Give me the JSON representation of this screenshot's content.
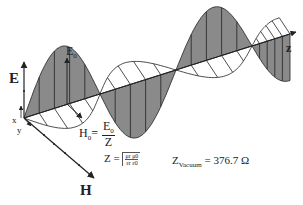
{
  "diagram": {
    "axes": {
      "E": "E",
      "H": "H",
      "z": "z",
      "x": "x",
      "y": "y"
    },
    "labels": {
      "E0_main": "E",
      "E0_sub": "0",
      "H0_main": "H",
      "H0_sub": "0",
      "H0_eq": "=",
      "H0_num_main": "E",
      "H0_num_sub": "0",
      "H0_den": "Z",
      "Z_lhs": "Z =",
      "Z_num": "μr μ0",
      "Z_den": "εr ε0",
      "Zvac_main": "Z",
      "Zvac_sub": "Vacuum",
      "Zvac_value": "= 376.7 Ω"
    },
    "colors": {
      "E_fill": "#8a8a8a",
      "H_fill": "#ffffff",
      "stroke": "#222222"
    }
  }
}
